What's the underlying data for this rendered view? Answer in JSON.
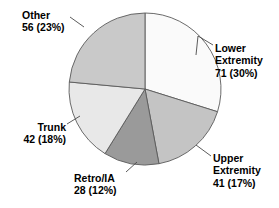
{
  "chart_data": {
    "type": "pie",
    "title": "",
    "subtitle": "",
    "xlabel": "",
    "ylabel": "",
    "total": 238,
    "legend_position": "none",
    "grid": false,
    "labels_show_value": true,
    "labels_show_percent": true,
    "start_angle_deg": 0,
    "direction": "clockwise",
    "categories": [
      "Lower Extremity",
      "Upper Extremity",
      "Retro/IA",
      "Trunk",
      "Other"
    ],
    "values": [
      71,
      41,
      28,
      42,
      56
    ],
    "percents": [
      30,
      17,
      12,
      18,
      23
    ],
    "colors": [
      "#fafafa",
      "#c4c4c4",
      "#9a9a9a",
      "#e8e8e8",
      "#c9c9c9"
    ],
    "slices": [
      {
        "name": "Lower Extremity",
        "value": 71,
        "percent": 30,
        "color": "#fafafa",
        "label_lines": [
          "Lower",
          "Extremity",
          "71 (30%)"
        ],
        "value_text": "71 (30%)"
      },
      {
        "name": "Upper Extremity",
        "value": 41,
        "percent": 17,
        "color": "#c4c4c4",
        "label_lines": [
          "Upper",
          "Extremity",
          "41 (17%)"
        ],
        "value_text": "41 (17%)"
      },
      {
        "name": "Retro/IA",
        "value": 28,
        "percent": 12,
        "color": "#9a9a9a",
        "label_lines": [
          "Retro/IA",
          "28 (12%)"
        ],
        "value_text": "28 (12%)"
      },
      {
        "name": "Trunk",
        "value": 42,
        "percent": 18,
        "color": "#e8e8e8",
        "label_lines": [
          "Trunk",
          "42 (18%)"
        ],
        "value_text": "42 (18%)"
      },
      {
        "name": "Other",
        "value": 56,
        "percent": 23,
        "color": "#c9c9c9",
        "label_lines": [
          "Other",
          "56 (23%)"
        ],
        "value_text": "56 (23%)"
      }
    ]
  },
  "labels": {
    "lower": {
      "l1": "Lower",
      "l2": "Extremity",
      "l3": "71 (30%)"
    },
    "upper": {
      "l1": "Upper",
      "l2": "Extremity",
      "l3": "41 (17%)"
    },
    "retro": {
      "l1": "Retro/IA",
      "l2": "28 (12%)"
    },
    "trunk": {
      "l1": "Trunk",
      "l2": "42 (18%)"
    },
    "other": {
      "l1": "Other",
      "l2": "56 (23%)"
    }
  }
}
